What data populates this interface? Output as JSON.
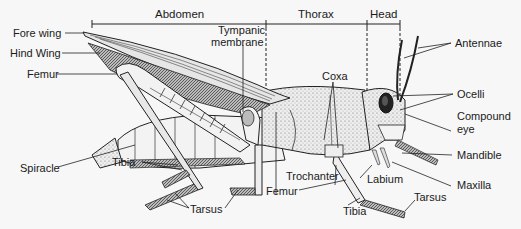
{
  "diagram": {
    "sections": [
      {
        "label": "Abdomen"
      },
      {
        "label": "Thorax"
      },
      {
        "label": "Head"
      }
    ],
    "labels": {
      "fore_wing": "Fore wing",
      "hind_wing": "Hind Wing",
      "femur_hind": "Femur",
      "spiracle": "Spiracle",
      "tibia_hind": "Tibia",
      "tarsus_hind": "Tarsus",
      "tympanic_membrane_1": "Tympanic",
      "tympanic_membrane_2": "membrane",
      "coxa": "Coxa",
      "trochanter": "Trochanter",
      "femur_front": "Femur",
      "labium": "Labium",
      "tibia_front": "Tibia",
      "tarsus_front": "Tarsus",
      "antennae": "Antennae",
      "ocelli": "Ocelli",
      "compound_eye_1": "Compound",
      "compound_eye_2": "eye",
      "mandible": "Mandible",
      "maxilla": "Maxilla"
    },
    "colors": {
      "background": "#f7f7f7",
      "ink": "#1a1a1a"
    }
  }
}
